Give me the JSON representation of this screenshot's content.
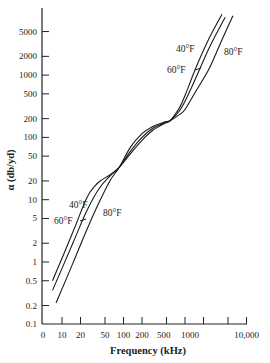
{
  "chart_data": {
    "type": "line",
    "title": "",
    "xlabel": "Frequency (kHz)",
    "ylabel": "α (db/yd)",
    "xscale": "log",
    "yscale": "log",
    "xlim": [
      5,
      10000
    ],
    "ylim": [
      0.1,
      10000
    ],
    "grid": false,
    "legend": "inline labels",
    "x_ticks": [
      {
        "value": 10,
        "label": "10"
      },
      {
        "value": 20,
        "label": "20"
      },
      {
        "value": 50,
        "label": "50"
      },
      {
        "value": 100,
        "label": "100"
      },
      {
        "value": 200,
        "label": "200"
      },
      {
        "value": 500,
        "label": "500"
      },
      {
        "value": 1000,
        "label": "1000"
      },
      {
        "value": 2000,
        "label": ""
      },
      {
        "value": 5000,
        "label": ""
      },
      {
        "value": 10000,
        "label": "10,000"
      }
    ],
    "x_origin_label": "0",
    "y_ticks": [
      {
        "value": 0.1,
        "label": "0.1"
      },
      {
        "value": 0.2,
        "label": "0.2"
      },
      {
        "value": 0.5,
        "label": "0.5"
      },
      {
        "value": 1,
        "label": "1"
      },
      {
        "value": 2,
        "label": "2"
      },
      {
        "value": 5,
        "label": "5"
      },
      {
        "value": 10,
        "label": "10"
      },
      {
        "value": 20,
        "label": "20"
      },
      {
        "value": 50,
        "label": "50"
      },
      {
        "value": 100,
        "label": "100"
      },
      {
        "value": 200,
        "label": "200"
      },
      {
        "value": 500,
        "label": "500"
      },
      {
        "value": 1000,
        "label": "1000"
      },
      {
        "value": 2000,
        "label": "2000"
      },
      {
        "value": 5000,
        "label": "5000"
      }
    ],
    "series": [
      {
        "name": "40°F",
        "x": [
          7,
          15,
          25,
          35,
          45,
          60,
          85,
          130,
          200,
          300,
          450,
          570,
          800,
          1000,
          1500,
          2500,
          4000
        ],
        "y": [
          0.5,
          3.0,
          10.5,
          17,
          21,
          25,
          33,
          55,
          90,
          130,
          165,
          185,
          290,
          470,
          1300,
          4000,
          9500
        ]
      },
      {
        "name": "60°F",
        "x": [
          7,
          15,
          25,
          40,
          60,
          85,
          130,
          200,
          300,
          450,
          570,
          800,
          1000,
          1500,
          2500,
          4500
        ],
        "y": [
          0.35,
          2.0,
          6.5,
          15,
          24,
          33,
          60,
          100,
          140,
          170,
          185,
          260,
          380,
          900,
          2800,
          8500
        ]
      },
      {
        "name": "80°F",
        "x": [
          8,
          15,
          25,
          40,
          60,
          85,
          130,
          200,
          300,
          450,
          570,
          800,
          1000,
          1500,
          2500,
          4000,
          6000
        ],
        "y": [
          0.22,
          0.95,
          3.2,
          9,
          20,
          33,
          70,
          115,
          150,
          175,
          185,
          230,
          280,
          550,
          1300,
          3700,
          9000
        ]
      }
    ],
    "annotations": [
      {
        "text": "40°F",
        "x_px": 176,
        "y_px": 52
      },
      {
        "text": "60°F",
        "x_px": 167,
        "y_px": 73
      },
      {
        "text": "80°F",
        "x_px": 224,
        "y_px": 55
      },
      {
        "text": "40°F",
        "x_px": 69,
        "y_px": 208
      },
      {
        "text": "60°F",
        "x_px": 54,
        "y_px": 224
      },
      {
        "text": "80°F",
        "x_px": 103,
        "y_px": 216
      }
    ]
  }
}
